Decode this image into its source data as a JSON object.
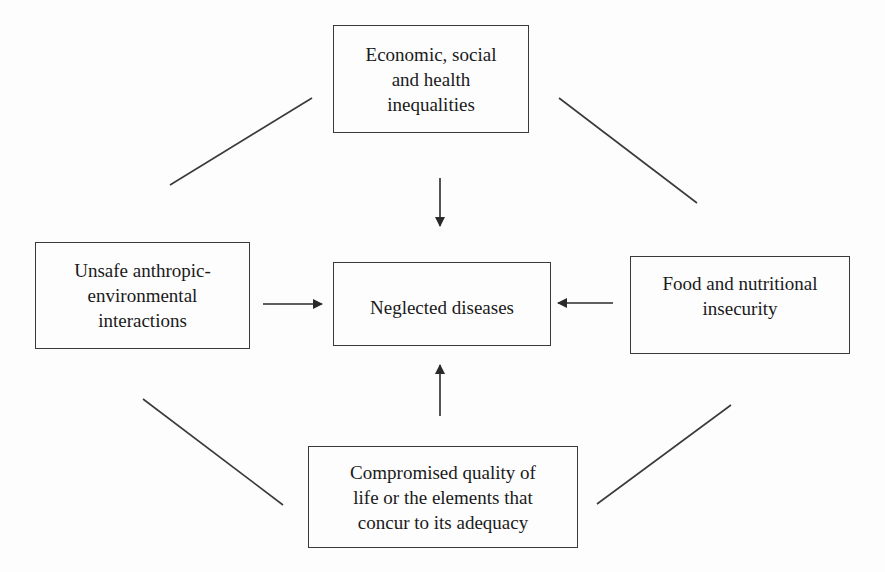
{
  "diagram": {
    "type": "conceptual-flow",
    "central_node": {
      "id": "center",
      "label": "Neglected diseases"
    },
    "nodes": [
      {
        "id": "top",
        "label": "Economic, social\nand health\ninequalities"
      },
      {
        "id": "left",
        "label": "Unsafe anthropic-\nenvironmental\ninteractions"
      },
      {
        "id": "right",
        "label": "Food and nutritional\ninsecurity"
      },
      {
        "id": "bottom",
        "label": "Compromised quality of\nlife or the elements that\nconcur to its adequacy"
      }
    ],
    "edges": [
      {
        "from": "top",
        "to": "center",
        "style": "arrow"
      },
      {
        "from": "left",
        "to": "center",
        "style": "arrow"
      },
      {
        "from": "right",
        "to": "center",
        "style": "arrow"
      },
      {
        "from": "bottom",
        "to": "center",
        "style": "arrow"
      },
      {
        "from": "top",
        "to": "left",
        "style": "line"
      },
      {
        "from": "top",
        "to": "right",
        "style": "line"
      },
      {
        "from": "left",
        "to": "bottom",
        "style": "line"
      },
      {
        "from": "right",
        "to": "bottom",
        "style": "line"
      }
    ],
    "colors": {
      "stroke": "#3a3a3a",
      "text": "#1a1a1a",
      "background": "#fdfdfd"
    }
  }
}
